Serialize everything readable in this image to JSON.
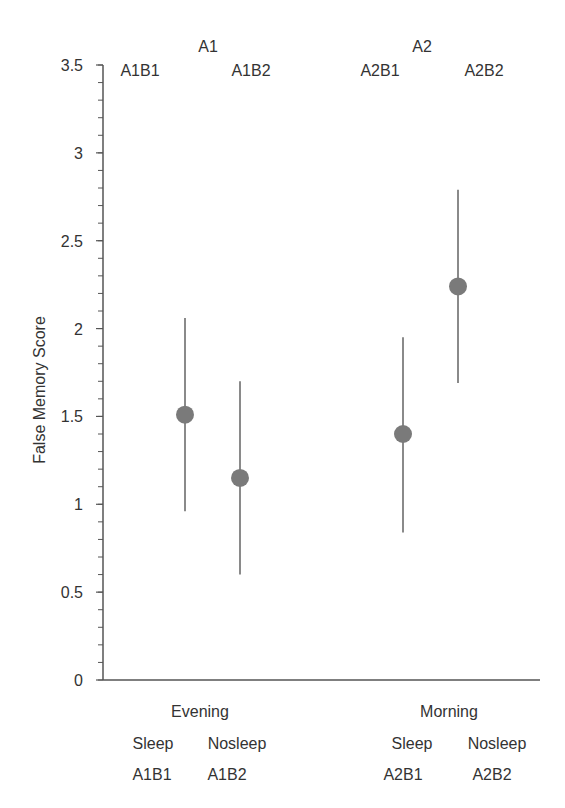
{
  "chart_data": {
    "type": "scatter",
    "subtype": "dot-with-error-bars",
    "title": "",
    "xlabel": "",
    "ylabel": "False Memory Score",
    "ylim": [
      0,
      3.5
    ],
    "y_ticks": [
      0,
      0.5,
      1,
      1.5,
      2,
      2.5,
      3,
      3.5
    ],
    "y_tick_labels": [
      "0",
      "0.5",
      "1",
      "1.5",
      "2",
      "2.5",
      "3",
      "3.5"
    ],
    "y_minor_tick_step": 0.1,
    "grid": false,
    "legend": null,
    "groups": [
      {
        "name": "Evening",
        "top_label": "A1",
        "points": [
          {
            "condition": "Sleep",
            "code": "A1B1",
            "mean": 1.51,
            "upper": 2.06,
            "lower": 0.96
          },
          {
            "condition": "Nosleep",
            "code": "A1B2",
            "mean": 1.15,
            "upper": 1.7,
            "lower": 0.6
          }
        ]
      },
      {
        "name": "Morning",
        "top_label": "A2",
        "points": [
          {
            "condition": "Sleep",
            "code": "A2B1",
            "mean": 1.4,
            "upper": 1.95,
            "lower": 0.84
          },
          {
            "condition": "Nosleep",
            "code": "A2B2",
            "mean": 2.24,
            "upper": 2.79,
            "lower": 1.69
          }
        ]
      }
    ],
    "colors": {
      "marker": "#7a7a7a",
      "error_bar": "#8a8a8a",
      "axis": "#555555",
      "text": "#333333"
    }
  }
}
